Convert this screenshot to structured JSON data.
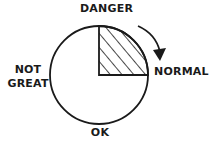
{
  "diagram": {
    "type": "gauge-dial",
    "labels": {
      "top": "DANGER",
      "right": "NORMAL",
      "bottom": "OK",
      "left_line1": "NOT",
      "left_line2": "GREAT"
    },
    "shaded_sector": {
      "from": "DANGER",
      "to": "NORMAL",
      "fill": "hatched"
    },
    "arrow": {
      "direction": "clockwise",
      "from": "DANGER",
      "to": "NORMAL"
    },
    "colors": {
      "ink": "#1a1a1a",
      "background": "#ffffff"
    }
  }
}
